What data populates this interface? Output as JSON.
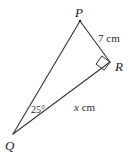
{
  "figure": {
    "type": "geometry-diagram",
    "shape": "right-triangle",
    "background_color": "#ffffff",
    "stroke_color": "#333333",
    "text_color": "#1a1a1a",
    "vertices": [
      {
        "id": "P",
        "label": "P",
        "x": 80,
        "y": 21
      },
      {
        "id": "R",
        "label": "R",
        "x": 110,
        "y": 62
      },
      {
        "id": "Q",
        "label": "Q",
        "x": 13,
        "y": 134
      }
    ],
    "sides": [
      {
        "id": "PR",
        "from": "P",
        "to": "R",
        "label": "7 cm",
        "value": "7",
        "unit": "cm"
      },
      {
        "id": "QR",
        "from": "Q",
        "to": "R",
        "label": "x cm",
        "value": "x",
        "unit": "cm"
      },
      {
        "id": "PQ",
        "from": "P",
        "to": "Q",
        "label": ""
      }
    ],
    "angles": [
      {
        "at": "Q",
        "label": "25°",
        "value": 25,
        "unit": "degrees"
      },
      {
        "at": "R",
        "label": "",
        "value": 90,
        "unit": "degrees",
        "marker": "right-angle-square"
      }
    ]
  },
  "labels": {
    "vertex_P": "P",
    "vertex_R": "R",
    "vertex_Q": "Q",
    "side_PR": "7 cm",
    "side_QR_number": "x",
    "side_QR_unit": " cm",
    "angle_Q": "25°"
  }
}
